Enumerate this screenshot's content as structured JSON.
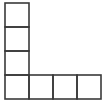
{
  "figure": {
    "name": "l-shaped-polyomino",
    "cell_count": 7,
    "cell_size_px": 24,
    "origin_x_px": 5,
    "origin_y_px": 3,
    "grid_columns": 4,
    "grid_rows": 4,
    "line_color": "#3a3a3a",
    "line_width_px": 1.6,
    "fill_color": "#ffffff",
    "background_color": "#ffffff",
    "cells": [
      {
        "name": "cell-col0-row0",
        "col": 0,
        "row": 0
      },
      {
        "name": "cell-col0-row1",
        "col": 0,
        "row": 1
      },
      {
        "name": "cell-col0-row2",
        "col": 0,
        "row": 2
      },
      {
        "name": "cell-col0-row3",
        "col": 0,
        "row": 3
      },
      {
        "name": "cell-col1-row3",
        "col": 1,
        "row": 3
      },
      {
        "name": "cell-col2-row3",
        "col": 2,
        "row": 3
      },
      {
        "name": "cell-col3-row3",
        "col": 3,
        "row": 3
      }
    ],
    "outline_points": "5,3 29,3 29,76 101,76 101,100 5,100 5,3",
    "internal_lines": [
      {
        "name": "divider-horizontal-1",
        "x1": 5,
        "y1": 27,
        "x2": 29,
        "y2": 27
      },
      {
        "name": "divider-horizontal-2",
        "x1": 5,
        "y1": 52,
        "x2": 29,
        "y2": 52
      },
      {
        "name": "divider-vertical-1",
        "x1": 53,
        "y1": 76,
        "x2": 53,
        "y2": 100
      },
      {
        "name": "divider-vertical-2",
        "x1": 77,
        "y1": 76,
        "x2": 77,
        "y2": 100
      }
    ]
  }
}
